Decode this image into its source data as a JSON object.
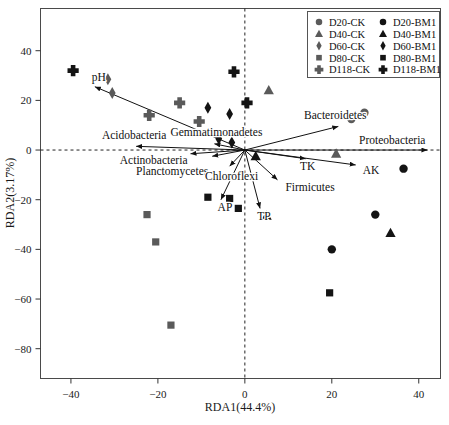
{
  "chart_data": {
    "type": "scatter",
    "title": "",
    "xlabel": "RDA1(44.4%)",
    "ylabel": "RDA2(3.17%)",
    "xlim": [
      -47,
      45
    ],
    "ylim": [
      -92,
      57
    ],
    "xticks": [
      -40,
      -20,
      0,
      20,
      40
    ],
    "yticks": [
      40,
      20,
      0,
      -20,
      -40,
      -60,
      -80
    ],
    "grid": false,
    "legend_position": "top-right",
    "series": [
      {
        "name": "D20-CK",
        "marker": "circle",
        "color": "#5a5a5a",
        "points": [
          [
            24.5,
            12.5
          ],
          [
            27.5,
            15.0
          ]
        ]
      },
      {
        "name": "D20-BM1",
        "marker": "circle",
        "color": "#141414",
        "points": [
          [
            36.5,
            -7.5
          ],
          [
            30.0,
            -26.0
          ],
          [
            20.0,
            -40.0
          ]
        ]
      },
      {
        "name": "D40-CK",
        "marker": "triangle",
        "color": "#5a5a5a",
        "points": [
          [
            5.5,
            24.0
          ],
          [
            21.0,
            -1.5
          ]
        ]
      },
      {
        "name": "D40-BM1",
        "marker": "triangle",
        "color": "#141414",
        "points": [
          [
            2.5,
            -2.5
          ],
          [
            5.0,
            -26.5
          ],
          [
            33.5,
            -33.5
          ]
        ]
      },
      {
        "name": "D60-CK",
        "marker": "diamond",
        "color": "#5a5a5a",
        "points": [
          [
            -31.5,
            28.5
          ],
          [
            -30.5,
            23.0
          ]
        ]
      },
      {
        "name": "D60-BM1",
        "marker": "diamond",
        "color": "#141414",
        "points": [
          [
            -8.5,
            17.0
          ],
          [
            -3.5,
            14.5
          ],
          [
            -6.0,
            4.5
          ],
          [
            -3.0,
            3.0
          ]
        ]
      },
      {
        "name": "D80-CK",
        "marker": "square",
        "color": "#5a5a5a",
        "points": [
          [
            -22.5,
            -26.0
          ],
          [
            -20.5,
            -37.0
          ],
          [
            -17.0,
            -70.5
          ]
        ]
      },
      {
        "name": "D80-BM1",
        "marker": "square",
        "color": "#141414",
        "points": [
          [
            -8.5,
            -19.0
          ],
          [
            -3.5,
            -19.5
          ],
          [
            -1.5,
            -23.5
          ],
          [
            19.5,
            -57.5
          ]
        ]
      },
      {
        "name": "D118-CK",
        "marker": "cross",
        "color": "#5a5a5a",
        "points": [
          [
            -22.0,
            14.0
          ],
          [
            -15.0,
            19.0
          ],
          [
            -10.5,
            11.5
          ]
        ]
      },
      {
        "name": "D118-BM1",
        "marker": "cross",
        "color": "#141414",
        "points": [
          [
            -39.5,
            32.0
          ],
          [
            -2.5,
            31.5
          ],
          [
            0.5,
            19.0
          ]
        ]
      }
    ],
    "vectors": [
      {
        "label": "pH",
        "x": -34.5,
        "y": 25.5,
        "label_dx": -3,
        "label_dy": -6,
        "anchor": "start"
      },
      {
        "label": "Acidobacteria",
        "x": -25.0,
        "y": 1.5,
        "label_dx": -2,
        "label_dy": -7,
        "anchor": "middle"
      },
      {
        "label": "Actinobacteria",
        "x": -12.5,
        "y": -1.5,
        "label_dx": -3,
        "label_dy": 10,
        "anchor": "end"
      },
      {
        "label": "Planctomycetes",
        "x": -7.5,
        "y": -2.5,
        "label_dx": -4,
        "label_dy": 19,
        "anchor": "end"
      },
      {
        "label": "Gemmatimonadetes",
        "x": -7.0,
        "y": 2.5,
        "label_dx": 2,
        "label_dy": -8,
        "anchor": "middle"
      },
      {
        "label": "Chloroflexi",
        "x": -3.5,
        "y": -6.5,
        "label_dx": 2,
        "label_dy": 14,
        "anchor": "middle"
      },
      {
        "label": "AP",
        "x": -5.5,
        "y": -20.0,
        "label_dx": 4,
        "label_dy": 11,
        "anchor": "middle"
      },
      {
        "label": "TP",
        "x": 3.5,
        "y": -23.5,
        "label_dx": 4,
        "label_dy": 12,
        "anchor": "middle"
      },
      {
        "label": "Firmicutes",
        "x": 7.5,
        "y": -12.0,
        "label_dx": 8,
        "label_dy": 11,
        "anchor": "start"
      },
      {
        "label": "TK",
        "x": 14.0,
        "y": -3.5,
        "label_dx": 2,
        "label_dy": 11,
        "anchor": "middle"
      },
      {
        "label": "AK",
        "x": 25.5,
        "y": -6.0,
        "label_dx": 7,
        "label_dy": 9,
        "anchor": "start"
      },
      {
        "label": "Bacteroidetes",
        "x": 21.5,
        "y": 9.5,
        "label_dx": -3,
        "label_dy": -7,
        "anchor": "middle"
      },
      {
        "label": "Proteobacteria",
        "x": 42.0,
        "y": 0.0,
        "label_dx": -2,
        "label_dy": -6,
        "anchor": "end"
      }
    ],
    "legend_entries": [
      {
        "label": "D20-CK",
        "marker": "circle",
        "color": "#5a5a5a"
      },
      {
        "label": "D20-BM1",
        "marker": "circle",
        "color": "#141414"
      },
      {
        "label": "D40-CK",
        "marker": "triangle",
        "color": "#5a5a5a"
      },
      {
        "label": "D40-BM1",
        "marker": "triangle",
        "color": "#141414"
      },
      {
        "label": "D60-CK",
        "marker": "diamond",
        "color": "#5a5a5a"
      },
      {
        "label": "D60-BM1",
        "marker": "diamond",
        "color": "#141414"
      },
      {
        "label": "D80-CK",
        "marker": "square",
        "color": "#5a5a5a"
      },
      {
        "label": "D80-BM1",
        "marker": "square",
        "color": "#141414"
      },
      {
        "label": "D118-CK",
        "marker": "cross",
        "color": "#5a5a5a"
      },
      {
        "label": "D118-BM1",
        "marker": "cross",
        "color": "#141414"
      }
    ]
  }
}
